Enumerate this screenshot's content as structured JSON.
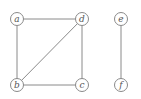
{
  "graph": {
    "nodes": [
      {
        "id": "a",
        "label": "a"
      },
      {
        "id": "b",
        "label": "b"
      },
      {
        "id": "c",
        "label": "c"
      },
      {
        "id": "d",
        "label": "d"
      },
      {
        "id": "e",
        "label": "e"
      },
      {
        "id": "f",
        "label": "f"
      }
    ],
    "edges": [
      {
        "from": "a",
        "to": "d"
      },
      {
        "from": "a",
        "to": "b"
      },
      {
        "from": "b",
        "to": "d"
      },
      {
        "from": "b",
        "to": "c"
      },
      {
        "from": "d",
        "to": "c"
      },
      {
        "from": "e",
        "to": "f"
      }
    ]
  }
}
